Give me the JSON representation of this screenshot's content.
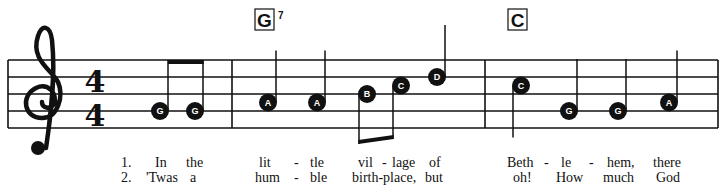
{
  "clef": "treble",
  "time_signature": {
    "top": "4",
    "bottom": "4"
  },
  "chords": [
    {
      "name": "G",
      "sup": "7",
      "measure": 2
    },
    {
      "name": "C",
      "sup": "",
      "measure": 3
    }
  ],
  "measures": [
    {
      "notes": [
        {
          "letter": "G",
          "duration": "eighth",
          "beam_group": 1
        },
        {
          "letter": "G",
          "duration": "eighth",
          "beam_group": 1
        }
      ]
    },
    {
      "notes": [
        {
          "letter": "A",
          "duration": "quarter"
        },
        {
          "letter": "A",
          "duration": "quarter"
        },
        {
          "letter": "B",
          "duration": "eighth",
          "beam_group": 2
        },
        {
          "letter": "C",
          "duration": "eighth",
          "beam_group": 2
        },
        {
          "letter": "D",
          "duration": "quarter"
        }
      ]
    },
    {
      "notes": [
        {
          "letter": "C",
          "duration": "quarter"
        },
        {
          "letter": "G",
          "duration": "quarter"
        },
        {
          "letter": "G",
          "duration": "quarter"
        },
        {
          "letter": "A",
          "duration": "quarter"
        }
      ]
    }
  ],
  "lyrics": {
    "verse1": {
      "number": "1.",
      "syllables": [
        "In",
        "the",
        "lit",
        "-",
        "tle",
        "vil",
        "-",
        "lage",
        "of",
        "Beth",
        "-",
        "le",
        "-",
        "hem,",
        "there"
      ]
    },
    "verse2": {
      "number": "2.",
      "syllables": [
        "'Twas",
        "a",
        "hum",
        "-",
        "ble",
        "birth-place,",
        "but",
        "oh!",
        "How",
        "much",
        "God"
      ]
    }
  }
}
